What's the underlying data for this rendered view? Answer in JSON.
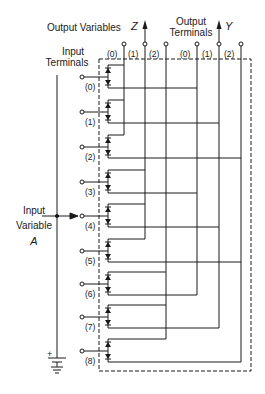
{
  "labels": {
    "output_variables": "Output Variables",
    "output_terminals_line1": "Output",
    "output_terminals_line2": "Terminals",
    "input_terminals_line1": "Input",
    "input_terminals_line2": "Terminals",
    "input_variable_line1": "Input",
    "input_variable_line2": "Variable",
    "input_variable_name": "A",
    "battery_polarity": "+"
  },
  "output_groups": [
    {
      "name": "Z",
      "columns": [
        {
          "label": "(0)",
          "x": 124
        },
        {
          "label": "(1)",
          "x": 145
        },
        {
          "label": "(2)",
          "x": 166
        }
      ],
      "arrow_column": 1
    },
    {
      "name": "Y",
      "columns": [
        {
          "label": "(0)",
          "x": 197
        },
        {
          "label": "(1)",
          "x": 219
        },
        {
          "label": "(2)",
          "x": 241
        }
      ],
      "arrow_column": 1
    }
  ],
  "input_terminals": [
    {
      "label": "(0)",
      "y": 77,
      "z": 0,
      "y_out": 0
    },
    {
      "label": "(1)",
      "y": 112,
      "z": 0,
      "y_out": 1
    },
    {
      "label": "(2)",
      "y": 147,
      "z": 0,
      "y_out": 2
    },
    {
      "label": "(3)",
      "y": 182,
      "z": 1,
      "y_out": 0
    },
    {
      "label": "(4)",
      "y": 216,
      "z": 1,
      "y_out": 1
    },
    {
      "label": "(5)",
      "y": 251,
      "z": 1,
      "y_out": 2
    },
    {
      "label": "(6)",
      "y": 284,
      "z": 2,
      "y_out": 0
    },
    {
      "label": "(7)",
      "y": 317,
      "z": 2,
      "y_out": 1
    },
    {
      "label": "(8)",
      "y": 351,
      "z": 2,
      "y_out": 2
    }
  ],
  "selected_input_terminal": 4,
  "colors": {
    "line": "#1a1a1a",
    "background": "#ffffff"
  }
}
